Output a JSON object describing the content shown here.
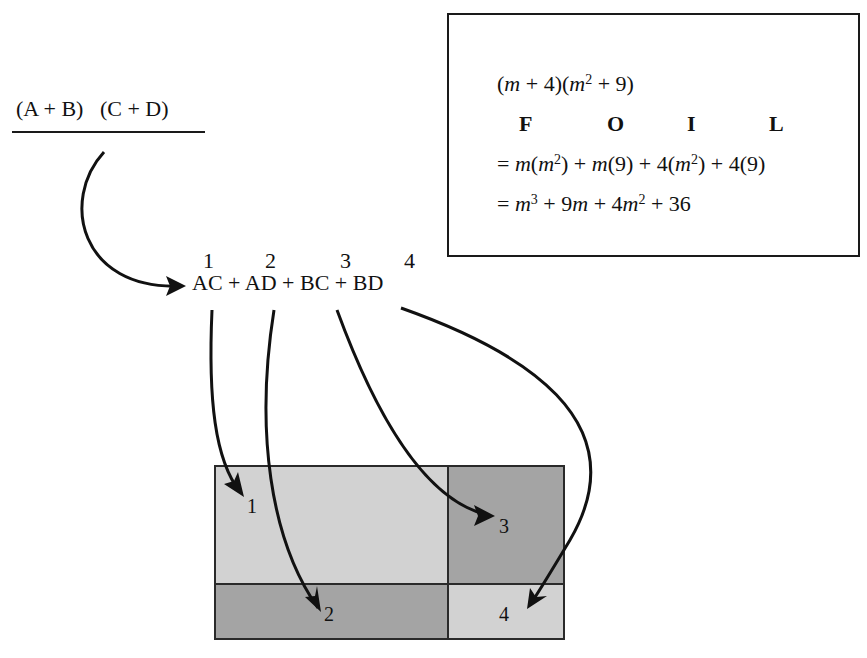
{
  "binomial_header": {
    "left": "(A + B)",
    "right": "(C + D)"
  },
  "expansion": {
    "term_numbers": [
      "1",
      "2",
      "3",
      "4"
    ],
    "terms": [
      "AC",
      "AD",
      "BC",
      "BD"
    ],
    "operator": "+"
  },
  "foil_box": {
    "problem": "(m + 4)(m² + 9)",
    "letters": [
      "F",
      "O",
      "I",
      "L"
    ],
    "step1": "= m(m²) + m(9) + 4(m²) + 4(9)",
    "step2": "= m³ + 9m + 4m² + 36"
  },
  "area_grid": {
    "cells": [
      {
        "label": "1",
        "term": "AC",
        "shade": "#d2d2d2"
      },
      {
        "label": "2",
        "term": "AD",
        "shade": "#a4a4a4"
      },
      {
        "label": "3",
        "term": "BC",
        "shade": "#a4a4a4"
      },
      {
        "label": "4",
        "term": "BD",
        "shade": "#d2d2d2"
      }
    ],
    "border_color": "#2a2a2a"
  }
}
